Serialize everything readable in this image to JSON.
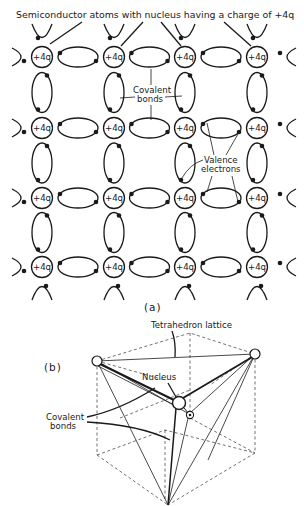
{
  "figure": {
    "panel_a": {
      "title": "Semiconductor atoms with nucleus having a charge of +4q",
      "atom_charge_label": "+4q",
      "annotations": {
        "covalent_bonds_line1": "Covalent",
        "covalent_bonds_line2": "bonds",
        "valence_electrons_line1": "Valence",
        "valence_electrons_line2": "electrons"
      },
      "grid": {
        "columns": 4,
        "rows": 4
      },
      "caption": "(a)"
    },
    "panel_b": {
      "label": "(b)",
      "annotations": {
        "tetrahedron_lattice": "Tetrahedron lattice",
        "nucleus": "Nucleus",
        "covalent_bonds_line1": "Covalent",
        "covalent_bonds_line2": "bonds"
      }
    }
  }
}
